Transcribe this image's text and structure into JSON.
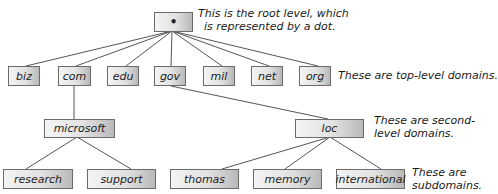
{
  "diagram": {
    "type": "dns-hierarchy-tree",
    "line_color": "#555555",
    "root": {
      "label": "•",
      "note_line1": "This is the root level, which",
      "note_line2": "is represented by a dot."
    },
    "top_level": {
      "nodes": [
        "biz",
        "com",
        "edu",
        "gov",
        "mil",
        "net",
        "org"
      ],
      "note": "These are top-level domains."
    },
    "second_level": {
      "nodes": [
        {
          "label": "microsoft",
          "parent": "com"
        },
        {
          "label": "loc",
          "parent": "gov"
        }
      ],
      "note_line1": "These are second-",
      "note_line2": "level domains."
    },
    "subdomains": {
      "nodes": [
        {
          "label": "research",
          "parent": "microsoft"
        },
        {
          "label": "support",
          "parent": "microsoft"
        },
        {
          "label": "thomas",
          "parent": "loc"
        },
        {
          "label": "memory",
          "parent": "loc"
        },
        {
          "label": "international",
          "parent": "loc"
        }
      ],
      "note_line1": "These are",
      "note_line2": "subdomains."
    }
  }
}
